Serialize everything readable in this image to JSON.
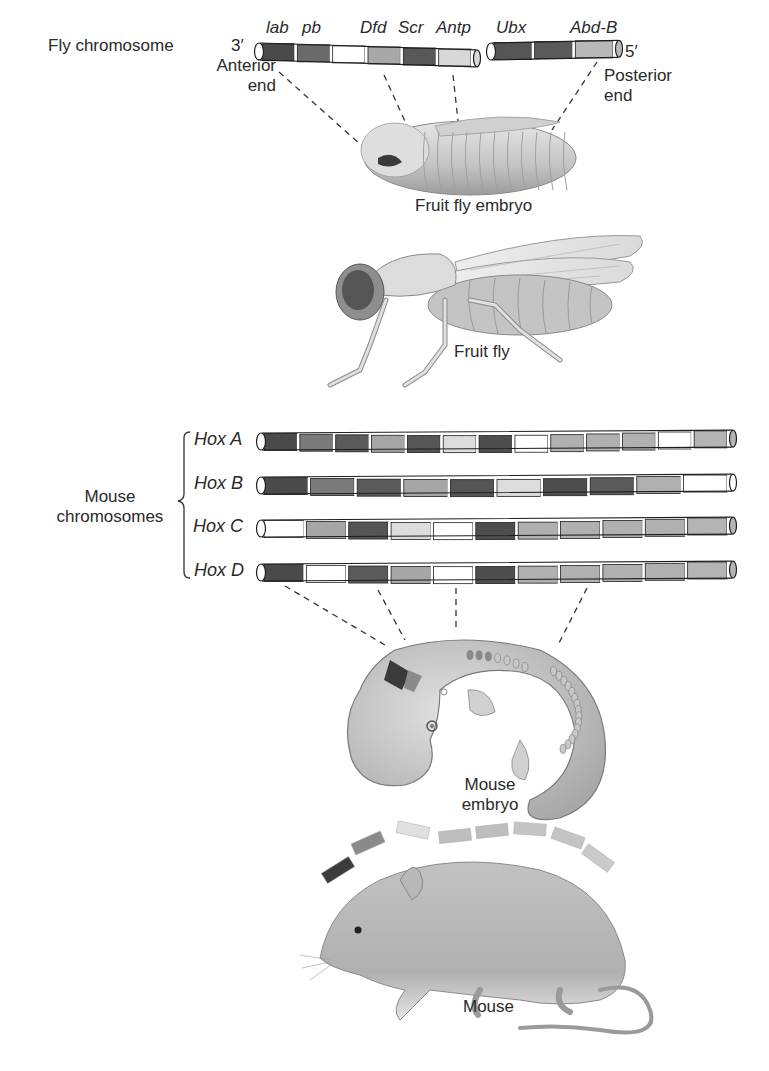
{
  "fly_chromosome": {
    "label": "Fly chromosome",
    "end_3": "3′",
    "end_5": "5′",
    "anterior_label_line1": "Anterior",
    "anterior_label_line2": "end",
    "posterior_label_line1": "Posterior",
    "posterior_label_line2": "end",
    "genes": [
      "lab",
      "pb",
      "Dfd",
      "Scr",
      "Antp",
      "Ubx",
      "Abd-B"
    ],
    "segment1_bands": [
      {
        "gene": "lab",
        "shade": "#4a4a4a"
      },
      {
        "gene": "pb",
        "shade": "#6a6a6a"
      },
      {
        "gene": "",
        "shade": "#ffffff"
      },
      {
        "gene": "Dfd",
        "shade": "#a8a8a8"
      },
      {
        "gene": "Scr",
        "shade": "#585858"
      },
      {
        "gene": "Antp",
        "shade": "#d8d8d8"
      }
    ],
    "segment2_bands": [
      {
        "gene": "Ubx",
        "shade": "#555555"
      },
      {
        "gene": "",
        "shade": "#5a5a5a"
      },
      {
        "gene": "Abd-B",
        "shade": "#b8b8b8"
      }
    ]
  },
  "fly_embryo": {
    "label": "Fruit fly embryo"
  },
  "fruit_fly": {
    "label": "Fruit fly"
  },
  "mouse_chromosomes": {
    "group_label_line1": "Mouse",
    "group_label_line2": "chromosomes",
    "clusters": [
      {
        "name": "Hox A",
        "bands": [
          "#4a4a4a",
          "#7a7a7a",
          "#5a5a5a",
          "#a6a6a6",
          "#555555",
          "#dcdcdc",
          "#4e4e4e",
          "#ffffff",
          "#b0b0b0",
          "#b0b0b0",
          "#b0b0b0",
          "#ffffff",
          "#b4b4b4"
        ]
      },
      {
        "name": "Hox B",
        "bands": [
          "#4a4a4a",
          "#7a7a7a",
          "#5a5a5a",
          "#a6a6a6",
          "#555555",
          "#dcdcdc",
          "#4e4e4e",
          "#5a5a5a",
          "#b0b0b0",
          "#ffffff"
        ]
      },
      {
        "name": "Hox C",
        "bands": [
          "#ffffff",
          "#a6a6a6",
          "#555555",
          "#dcdcdc",
          "#ffffff",
          "#4e4e4e",
          "#b0b0b0",
          "#b0b0b0",
          "#b0b0b0",
          "#b0b0b0",
          "#b4b4b4"
        ]
      },
      {
        "name": "Hox D",
        "bands": [
          "#4a4a4a",
          "#ffffff",
          "#5a5a5a",
          "#a6a6a6",
          "#ffffff",
          "#4e4e4e",
          "#b0b0b0",
          "#b0b0b0",
          "#b0b0b0",
          "#b0b0b0",
          "#b4b4b4"
        ]
      }
    ]
  },
  "mouse_embryo": {
    "label_line1": "Mouse",
    "label_line2": "embryo"
  },
  "mouse": {
    "label": "Mouse",
    "body_plan_bars": [
      "#3c3c3c",
      "#8a8a8a",
      "#e0e0e0",
      "#bdbdbd",
      "#bdbdbd",
      "#c4c4c4",
      "#c4c4c4",
      "#cacaca"
    ]
  },
  "colors": {
    "ink": "#2a2a2a",
    "outline": "#1e1e1e",
    "dark_band": "#4a4a4a",
    "mid_band": "#a8a8a8",
    "light_band": "#d8d8d8",
    "organism_fill": "#cfcfcf",
    "organism_shadow": "#9a9a9a"
  }
}
